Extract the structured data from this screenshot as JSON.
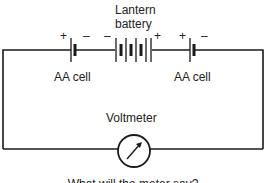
{
  "diagram": {
    "type": "circuit",
    "labels": {
      "lantern_battery_line1": "Lantern",
      "lantern_battery_line2": "battery",
      "aa_cell_left": "AA cell",
      "aa_cell_right": "AA cell",
      "voltmeter": "Voltmeter",
      "question": "What will the meter say?"
    },
    "polarity": {
      "left_cell_plus": "+",
      "left_cell_minus": "–",
      "lantern_minus": "–",
      "lantern_plus": "+",
      "right_cell_plus": "+",
      "right_cell_minus": "–"
    },
    "components": [
      {
        "name": "AA cell",
        "position": "left",
        "orientation": "+ on left, – on right"
      },
      {
        "name": "Lantern battery",
        "position": "center",
        "orientation": "– on left, + on right"
      },
      {
        "name": "AA cell",
        "position": "right",
        "orientation": "+ on left, – on right"
      },
      {
        "name": "Voltmeter",
        "position": "bottom center"
      }
    ],
    "colors": {
      "line": "#1a1a1a",
      "text": "#222222",
      "background": "#ffffff"
    }
  }
}
